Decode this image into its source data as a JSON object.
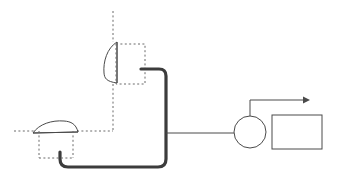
{
  "diagram": {
    "title": "Optical beam delivery schematic",
    "background_color": "#ffffff",
    "thin_line_color": "#4a4a4a",
    "thick_line_color": "#3c3c3c",
    "dashed_line_color": "#6b6b6b",
    "components": [
      {
        "id": "upper-lens",
        "label": "",
        "kind": "vertical-lens",
        "x": 105,
        "y": 42,
        "width": 16,
        "height": 41
      },
      {
        "id": "upper-mount-box",
        "label": "",
        "kind": "dashed-rectangle",
        "x": 116,
        "y": 44,
        "width": 29,
        "height": 40
      },
      {
        "id": "upper-optical-axis",
        "label": "",
        "kind": "dashed-vertical-axis",
        "x": 113,
        "y_start": 11,
        "y_end": 131
      },
      {
        "id": "lower-lens",
        "label": "",
        "kind": "horizontal-lens",
        "x": 33,
        "y": 122,
        "width": 45,
        "height": 12
      },
      {
        "id": "lower-mount-box",
        "label": "",
        "kind": "dashed-rectangle",
        "x": 39,
        "y": 131,
        "width": 34,
        "height": 27
      },
      {
        "id": "lower-optical-axis",
        "label": "",
        "kind": "dashed-horizontal-axis",
        "y": 131,
        "x_start": 14,
        "x_end": 113
      },
      {
        "id": "waveguide-pipe",
        "label": "",
        "kind": "thick-routed-pipe"
      },
      {
        "id": "feed-line",
        "label": "",
        "kind": "thin-horizontal-line",
        "y": 133,
        "x_start": 166,
        "x_end": 238
      },
      {
        "id": "circle-node",
        "label": "",
        "kind": "circle",
        "cx": 250,
        "cy": 132,
        "r": 16
      },
      {
        "id": "output-module",
        "label": "",
        "kind": "rectangle",
        "x": 272,
        "y": 115,
        "width": 50,
        "height": 34
      },
      {
        "id": "output-arrow",
        "label": "",
        "kind": "arrow",
        "direction": "right",
        "from_x": 250,
        "from_y": 100,
        "to_x": 307,
        "to_y": 100
      }
    ]
  }
}
